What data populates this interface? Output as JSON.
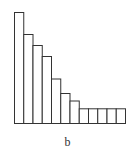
{
  "chart_data": {
    "type": "bar",
    "title": "",
    "xlabel": "b",
    "ylabel": "",
    "categories": [
      "1",
      "2",
      "3",
      "4",
      "5",
      "6",
      "7",
      "8",
      "9",
      "10",
      "11",
      "12"
    ],
    "values": [
      111,
      89,
      78,
      67,
      44.5,
      30,
      22.5,
      14.7,
      14.7,
      14.7,
      14.7,
      14.7
    ],
    "ylim": [
      0,
      111
    ],
    "grid": false,
    "legend": null,
    "bar_fill": "#ffffff",
    "bar_edge": "#333333",
    "axes_visible": false,
    "baseline_visible": true
  },
  "caption": "b",
  "layout": {
    "plot_left": 14,
    "plot_right": 125,
    "baseline_y": 123,
    "max_height_px": 111
  }
}
